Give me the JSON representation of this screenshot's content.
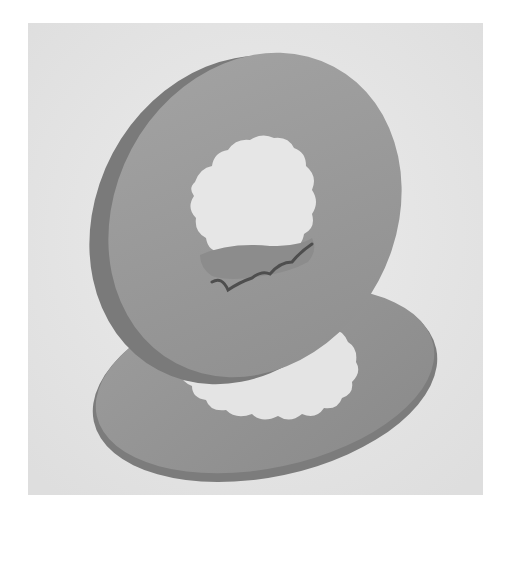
{
  "image": {
    "subject": "two splined ring washers",
    "style": "grayscale photograph",
    "colors": {
      "page_background": "#ffffff",
      "photo_background": "#e6e6e6",
      "washer_face": "#9a9a9a",
      "washer_edge": "#7e7e7e",
      "washer_shadow": "#5a5a5a"
    }
  }
}
